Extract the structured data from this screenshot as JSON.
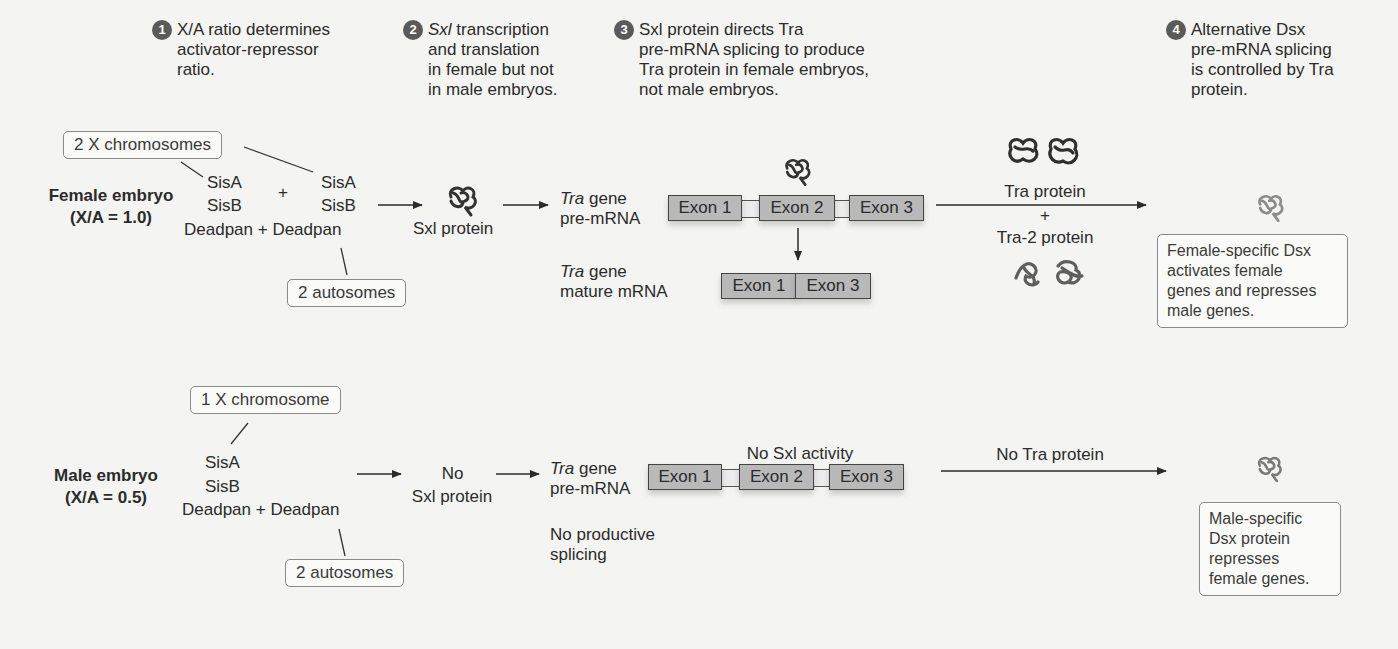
{
  "colors": {
    "background": "#f4f4f2",
    "text": "#2b2b2b",
    "step_badge": "#5a5a5a",
    "exon_fill": "#b9b9b9",
    "tra_protein": "#3a3a3a",
    "tra2_protein": "#6a6a6a",
    "dsx_protein": "#8a8a8a"
  },
  "steps": [
    {
      "num": "1",
      "lines": [
        "X/A ratio determines",
        "activator-repressor",
        "ratio."
      ]
    },
    {
      "num": "2",
      "italic_prefix": "Sxl",
      "lines": [
        " transcription",
        "and translation",
        "in female but not",
        "in male embryos."
      ]
    },
    {
      "num": "3",
      "lines": [
        "Sxl protein directs Tra",
        "pre-mRNA splicing to produce",
        "Tra protein in female embryos,",
        "not male embryos."
      ]
    },
    {
      "num": "4",
      "lines": [
        "Alternative Dsx",
        "pre-mRNA splicing",
        "is controlled by Tra",
        "protein."
      ]
    }
  ],
  "female": {
    "title": "Female embryo",
    "ratio": "(X/A = 1.0)",
    "x_box": "2 X chromosomes",
    "autosome_box": "2 autosomes",
    "activators_left": [
      "SisA",
      "SisB"
    ],
    "activators_right": [
      "SisA",
      "SisB"
    ],
    "plus": "+",
    "deadpan_line": "Deadpan + Deadpan",
    "sxl_label": "Sxl protein",
    "tra_pre": {
      "italic": "Tra",
      "rest": " gene",
      "line2": "pre-mRNA"
    },
    "tra_mature": {
      "italic": "Tra",
      "rest": " gene",
      "line2": "mature mRNA"
    },
    "exons": [
      "Exon 1",
      "Exon 2",
      "Exon 3"
    ],
    "mature_exons": [
      "Exon 1",
      "Exon 3"
    ],
    "arrow_top": "Tra protein",
    "arrow_plus": "+",
    "arrow_bottom": "Tra-2 protein",
    "outcome": [
      "Female-specific Dsx",
      "activates female",
      "genes and represses",
      "male genes."
    ]
  },
  "male": {
    "title": "Male embryo",
    "ratio": "(X/A = 0.5)",
    "x_box": "1 X chromosome",
    "autosome_box": "2 autosomes",
    "activators": [
      "SisA",
      "SisB"
    ],
    "deadpan_line": "Deadpan + Deadpan",
    "sxl_label_1": "No",
    "sxl_label_2": "Sxl protein",
    "tra_pre": {
      "italic": "Tra",
      "rest": " gene",
      "line2": "pre-mRNA"
    },
    "no_activity": "No Sxl activity",
    "exons": [
      "Exon 1",
      "Exon 2",
      "Exon 3"
    ],
    "no_splicing": [
      "No productive",
      "splicing"
    ],
    "arrow_top": "No Tra protein",
    "outcome": [
      "Male-specific",
      "Dsx protein",
      "represses",
      "female genes."
    ]
  }
}
